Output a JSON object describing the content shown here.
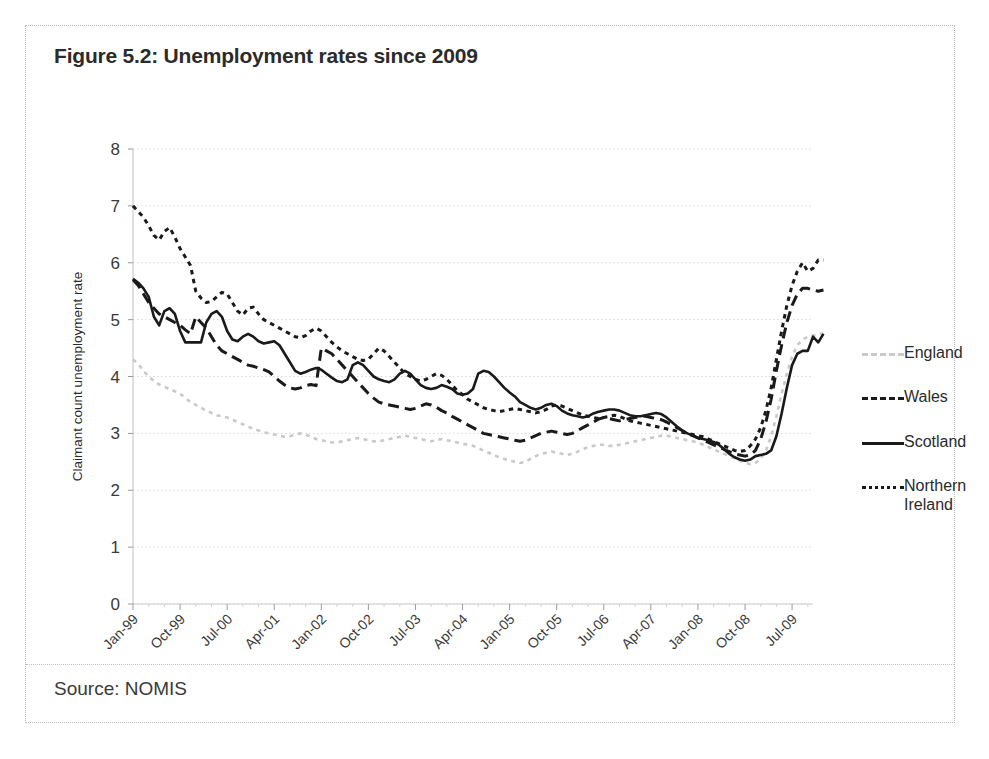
{
  "figure": {
    "title": "Figure 5.2: Unemployment rates since 2009",
    "source": "Source: NOMIS"
  },
  "chart_data": {
    "type": "line",
    "title": "Figure 5.2: Unemployment rates since 2009",
    "xlabel": "",
    "ylabel": "Claimant count unemployment rate",
    "ylim": [
      0,
      8
    ],
    "yticks": [
      0,
      1,
      2,
      3,
      4,
      5,
      6,
      7,
      8
    ],
    "grid": true,
    "legend_position": "right",
    "xtick_labels": [
      "Jan-99",
      "Oct-99",
      "Jul-00",
      "Apr-01",
      "Jan-02",
      "Oct-02",
      "Jul-03",
      "Apr-04",
      "Jan-05",
      "Oct-05",
      "Jul-06",
      "Apr-07",
      "Jan-08",
      "Oct-08",
      "Jul-09"
    ],
    "xtick_indices": [
      0,
      9,
      18,
      27,
      36,
      45,
      54,
      63,
      72,
      81,
      90,
      99,
      108,
      117,
      126
    ],
    "x_start": "Jan-99",
    "x_end": "Nov-09",
    "n_points": 131,
    "series": [
      {
        "name": "England",
        "color": "#c9c9c9",
        "style": "dotted",
        "values": [
          4.3,
          4.22,
          4.1,
          4.0,
          3.92,
          3.86,
          3.82,
          3.78,
          3.74,
          3.7,
          3.62,
          3.55,
          3.5,
          3.45,
          3.4,
          3.36,
          3.32,
          3.3,
          3.28,
          3.24,
          3.2,
          3.16,
          3.12,
          3.08,
          3.05,
          3.02,
          3.0,
          2.98,
          2.96,
          2.94,
          2.95,
          2.98,
          3.0,
          2.98,
          2.94,
          2.9,
          2.88,
          2.86,
          2.84,
          2.84,
          2.86,
          2.88,
          2.9,
          2.92,
          2.9,
          2.88,
          2.86,
          2.86,
          2.88,
          2.9,
          2.92,
          2.94,
          2.96,
          2.94,
          2.92,
          2.9,
          2.88,
          2.86,
          2.88,
          2.9,
          2.88,
          2.86,
          2.84,
          2.82,
          2.8,
          2.78,
          2.74,
          2.7,
          2.66,
          2.62,
          2.58,
          2.55,
          2.52,
          2.5,
          2.48,
          2.5,
          2.55,
          2.6,
          2.64,
          2.66,
          2.68,
          2.66,
          2.64,
          2.62,
          2.64,
          2.68,
          2.72,
          2.76,
          2.78,
          2.8,
          2.8,
          2.78,
          2.78,
          2.8,
          2.82,
          2.84,
          2.86,
          2.88,
          2.9,
          2.92,
          2.94,
          2.96,
          2.96,
          2.94,
          2.92,
          2.9,
          2.88,
          2.86,
          2.84,
          2.8,
          2.76,
          2.72,
          2.68,
          2.64,
          2.6,
          2.56,
          2.52,
          2.48,
          2.46,
          2.48,
          2.55,
          2.7,
          2.95,
          3.3,
          3.7,
          4.05,
          4.35,
          4.55,
          4.65,
          4.7,
          4.72,
          4.74,
          4.76
        ]
      },
      {
        "name": "Wales",
        "color": "#1a1a1a",
        "style": "dashed",
        "values": [
          5.7,
          5.6,
          5.45,
          5.3,
          5.2,
          5.1,
          5.05,
          5.0,
          4.95,
          4.9,
          4.82,
          4.75,
          5.05,
          4.95,
          4.85,
          4.7,
          4.55,
          4.45,
          4.4,
          4.35,
          4.3,
          4.25,
          4.2,
          4.18,
          4.15,
          4.12,
          4.08,
          4.0,
          3.92,
          3.85,
          3.8,
          3.78,
          3.8,
          3.84,
          3.86,
          3.84,
          4.5,
          4.45,
          4.4,
          4.3,
          4.2,
          4.1,
          4.0,
          3.9,
          3.8,
          3.7,
          3.62,
          3.55,
          3.52,
          3.5,
          3.48,
          3.46,
          3.44,
          3.42,
          3.44,
          3.48,
          3.52,
          3.5,
          3.46,
          3.4,
          3.36,
          3.3,
          3.25,
          3.2,
          3.15,
          3.1,
          3.05,
          3.0,
          2.98,
          2.96,
          2.94,
          2.92,
          2.9,
          2.88,
          2.86,
          2.88,
          2.92,
          2.96,
          3.0,
          3.02,
          3.04,
          3.02,
          3.0,
          2.98,
          3.0,
          3.05,
          3.1,
          3.15,
          3.2,
          3.25,
          3.28,
          3.26,
          3.24,
          3.22,
          3.24,
          3.26,
          3.28,
          3.3,
          3.3,
          3.28,
          3.26,
          3.24,
          3.2,
          3.15,
          3.1,
          3.05,
          3.0,
          2.96,
          2.92,
          2.88,
          2.84,
          2.8,
          2.76,
          2.72,
          2.68,
          2.64,
          2.62,
          2.6,
          2.62,
          2.7,
          2.9,
          3.2,
          3.6,
          4.1,
          4.55,
          4.95,
          5.25,
          5.45,
          5.55,
          5.55,
          5.52,
          5.5,
          5.52
        ]
      },
      {
        "name": "Scotland",
        "color": "#1a1a1a",
        "style": "solid",
        "values": [
          5.72,
          5.65,
          5.55,
          5.4,
          5.05,
          4.9,
          5.15,
          5.2,
          5.1,
          4.8,
          4.6,
          4.6,
          4.6,
          4.6,
          4.95,
          5.1,
          5.15,
          5.05,
          4.8,
          4.65,
          4.62,
          4.7,
          4.75,
          4.7,
          4.62,
          4.58,
          4.6,
          4.62,
          4.55,
          4.4,
          4.25,
          4.1,
          4.05,
          4.08,
          4.12,
          4.15,
          4.12,
          4.05,
          3.98,
          3.92,
          3.9,
          3.95,
          4.2,
          4.25,
          4.2,
          4.1,
          4.0,
          3.95,
          3.92,
          3.9,
          3.95,
          4.05,
          4.1,
          4.05,
          3.95,
          3.85,
          3.8,
          3.78,
          3.8,
          3.85,
          3.82,
          3.78,
          3.7,
          3.68,
          3.7,
          3.78,
          4.05,
          4.1,
          4.08,
          4.0,
          3.9,
          3.8,
          3.72,
          3.65,
          3.55,
          3.5,
          3.45,
          3.42,
          3.45,
          3.5,
          3.52,
          3.48,
          3.4,
          3.35,
          3.32,
          3.3,
          3.28,
          3.3,
          3.35,
          3.38,
          3.4,
          3.42,
          3.42,
          3.4,
          3.36,
          3.32,
          3.3,
          3.3,
          3.32,
          3.34,
          3.36,
          3.34,
          3.28,
          3.2,
          3.12,
          3.05,
          3.0,
          2.96,
          2.92,
          2.9,
          2.88,
          2.85,
          2.8,
          2.72,
          2.64,
          2.58,
          2.54,
          2.52,
          2.54,
          2.6,
          2.62,
          2.64,
          2.7,
          2.95,
          3.35,
          3.8,
          4.2,
          4.4,
          4.45,
          4.45,
          4.7,
          4.6,
          4.75
        ]
      },
      {
        "name": "Northern Ireland",
        "color": "#1a1a1a",
        "style": "dotted",
        "values": [
          7.0,
          6.9,
          6.8,
          6.65,
          6.48,
          6.4,
          6.55,
          6.62,
          6.45,
          6.25,
          6.1,
          5.95,
          5.5,
          5.38,
          5.3,
          5.32,
          5.4,
          5.48,
          5.45,
          5.3,
          5.15,
          5.08,
          5.2,
          5.22,
          5.1,
          5.0,
          4.95,
          4.9,
          4.85,
          4.8,
          4.75,
          4.7,
          4.68,
          4.72,
          4.8,
          4.85,
          4.8,
          4.7,
          4.6,
          4.52,
          4.45,
          4.4,
          4.35,
          4.3,
          4.28,
          4.3,
          4.4,
          4.5,
          4.45,
          4.35,
          4.25,
          4.15,
          4.05,
          4.0,
          3.95,
          3.92,
          3.95,
          4.0,
          4.05,
          4.02,
          3.95,
          3.85,
          3.75,
          3.68,
          3.6,
          3.55,
          3.5,
          3.45,
          3.42,
          3.4,
          3.38,
          3.4,
          3.42,
          3.44,
          3.42,
          3.4,
          3.38,
          3.36,
          3.38,
          3.42,
          3.48,
          3.5,
          3.48,
          3.44,
          3.4,
          3.36,
          3.32,
          3.3,
          3.28,
          3.26,
          3.28,
          3.3,
          3.32,
          3.3,
          3.26,
          3.22,
          3.2,
          3.18,
          3.16,
          3.14,
          3.12,
          3.1,
          3.08,
          3.06,
          3.04,
          3.02,
          3.0,
          2.98,
          2.96,
          2.94,
          2.9,
          2.86,
          2.82,
          2.78,
          2.74,
          2.7,
          2.68,
          2.7,
          2.78,
          2.9,
          3.1,
          3.4,
          3.8,
          4.3,
          4.8,
          5.25,
          5.6,
          5.85,
          6.0,
          5.85,
          5.9,
          6.05,
          6.05
        ]
      }
    ]
  },
  "legend": {
    "items": [
      {
        "label": "England"
      },
      {
        "label": "Wales"
      },
      {
        "label": "Scotland"
      },
      {
        "label": "Northern\nIreland"
      }
    ]
  }
}
